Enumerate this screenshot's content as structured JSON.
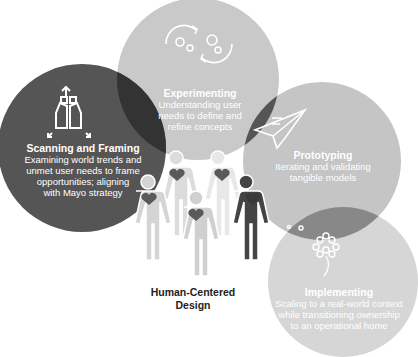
{
  "diagram": {
    "center_label": [
      "Human-Centered",
      "Design"
    ],
    "phases": [
      {
        "id": "scanning",
        "title": "Scanning and Framing",
        "description": [
          "Examining world trends and",
          "unmet user needs to frame",
          "opportunities; aligning",
          "with Mayo strategy"
        ],
        "icon": "binoculars-icon",
        "color": "#555555"
      },
      {
        "id": "experimenting",
        "title": "Experimenting",
        "description": [
          "Understanding user",
          "needs to define and",
          "refine concepts"
        ],
        "icon": "cycle-arrows-icon",
        "color": "#c9c9c9"
      },
      {
        "id": "prototyping",
        "title": "Prototyping",
        "description": [
          "Iterating and validating",
          "tangible models"
        ],
        "icon": "paper-plane-icon",
        "color": "#c5c5c5"
      },
      {
        "id": "implementing",
        "title": "Implementing",
        "description": [
          "Scaling to a real-world context",
          "while transitioning ownership",
          "to an operational home"
        ],
        "icon": "dandelion-icon",
        "color": "#d6d6d6"
      }
    ],
    "figures": 5
  }
}
